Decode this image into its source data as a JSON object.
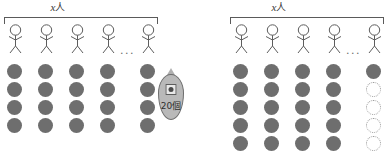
{
  "diagram": {
    "type": "pictogram",
    "background_color": "#ffffff",
    "dot_color": "#6e6e6e",
    "ghost_dot_color": "#9a9a9a",
    "line_color": "#5a5a5a",
    "groups": [
      {
        "id": "left",
        "brace_label_var": "x",
        "brace_label_unit": "人",
        "people_count_shown": 5,
        "ellipsis": "...",
        "dot_rows": 4,
        "dot_columns": 5,
        "columns": [
          {
            "filled": 4,
            "ghost": 0
          },
          {
            "filled": 4,
            "ghost": 0
          },
          {
            "filled": 4,
            "ghost": 0
          },
          {
            "filled": 4,
            "ghost": 0
          },
          {
            "filled": 4,
            "ghost": 0
          }
        ],
        "callout": {
          "text": "20個",
          "icon": "marble-icon"
        }
      },
      {
        "id": "right",
        "brace_label_var": "x",
        "brace_label_unit": "人",
        "people_count_shown": 5,
        "ellipsis": "...",
        "dot_rows": 5,
        "dot_columns": 5,
        "columns": [
          {
            "filled": 5,
            "ghost": 0
          },
          {
            "filled": 5,
            "ghost": 0
          },
          {
            "filled": 5,
            "ghost": 0
          },
          {
            "filled": 5,
            "ghost": 0
          },
          {
            "filled": 1,
            "ghost": 4
          }
        ],
        "callout": null
      }
    ]
  }
}
